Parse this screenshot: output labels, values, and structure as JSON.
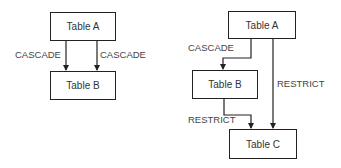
{
  "left_diagram": {
    "table_a": "Table A",
    "table_b": "Table B",
    "edge_left_label": "CASCADE",
    "edge_right_label": "CASCADE"
  },
  "right_diagram": {
    "table_a": "Table A",
    "table_b": "Table B",
    "table_c": "Table C",
    "edge_a_b_label": "CASCADE",
    "edge_a_c_label": "RESTRICT",
    "edge_b_c_label": "RESTRICT"
  },
  "colors": {
    "line": "#222222",
    "text": "#333333"
  }
}
